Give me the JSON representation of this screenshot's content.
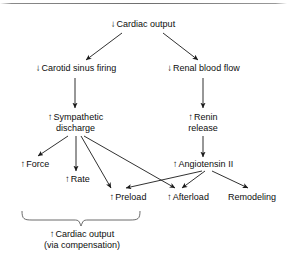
{
  "diagram": {
    "type": "flowchart",
    "text_color": "#0d0d0d",
    "line_color": "#1a1a1a",
    "background": "#ffffff",
    "up_arrow_glyph": "↑",
    "down_arrow_glyph": "↓",
    "nodes": [
      {
        "id": "cardiac-output-decreased",
        "direction": "down",
        "label": "Cardiac output",
        "line2": ""
      },
      {
        "id": "carotid-sinus-firing",
        "direction": "down",
        "label": "Carotid sinus firing",
        "line2": ""
      },
      {
        "id": "renal-blood-flow",
        "direction": "down",
        "label": "Renal blood flow",
        "line2": ""
      },
      {
        "id": "sympathetic-discharge",
        "direction": "up",
        "label": "Sympathetic",
        "line2": "discharge"
      },
      {
        "id": "renin-release",
        "direction": "up",
        "label": "Renin",
        "line2": "release"
      },
      {
        "id": "force",
        "direction": "up",
        "label": "Force",
        "line2": ""
      },
      {
        "id": "rate",
        "direction": "up",
        "label": "Rate",
        "line2": ""
      },
      {
        "id": "angiotensin-ii",
        "direction": "up",
        "label": "Angiotensin II",
        "line2": ""
      },
      {
        "id": "preload",
        "direction": "up",
        "label": "Preload",
        "line2": ""
      },
      {
        "id": "afterload",
        "direction": "up",
        "label": "Afterload",
        "line2": ""
      },
      {
        "id": "remodeling",
        "direction": "none",
        "label": "Remodeling",
        "line2": ""
      },
      {
        "id": "cardiac-output-compensated",
        "direction": "up",
        "label": "Cardiac output",
        "line2": "(via compensation)"
      }
    ],
    "edges": [
      {
        "from": "cardiac-output-decreased",
        "to": "carotid-sinus-firing"
      },
      {
        "from": "cardiac-output-decreased",
        "to": "renal-blood-flow"
      },
      {
        "from": "carotid-sinus-firing",
        "to": "sympathetic-discharge"
      },
      {
        "from": "renal-blood-flow",
        "to": "renin-release"
      },
      {
        "from": "sympathetic-discharge",
        "to": "force"
      },
      {
        "from": "sympathetic-discharge",
        "to": "rate"
      },
      {
        "from": "sympathetic-discharge",
        "to": "preload"
      },
      {
        "from": "sympathetic-discharge",
        "to": "afterload"
      },
      {
        "from": "renin-release",
        "to": "angiotensin-ii"
      },
      {
        "from": "angiotensin-ii",
        "to": "preload"
      },
      {
        "from": "angiotensin-ii",
        "to": "afterload"
      },
      {
        "from": "angiotensin-ii",
        "to": "remodeling"
      },
      {
        "from": "brace-group",
        "to": "cardiac-output-compensated"
      }
    ],
    "brace": {
      "groups": [
        "force",
        "rate",
        "preload"
      ],
      "label_target": "cardiac-output-compensated"
    }
  }
}
